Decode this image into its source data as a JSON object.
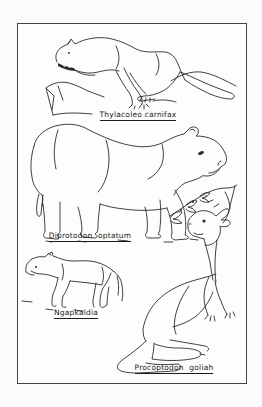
{
  "page": {
    "background_color": "#fbfbfb",
    "ink_color": "#2a2a2a",
    "frame_border_color": "#454545"
  },
  "figure": {
    "specimens": [
      {
        "label": "Thylacoleo carnifax"
      },
      {
        "label": "Diprotodon optatum"
      },
      {
        "label": "Ngapkaldia"
      },
      {
        "label": "Procoptodon goliah"
      }
    ]
  }
}
